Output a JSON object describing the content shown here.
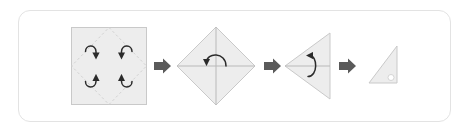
{
  "figure": {
    "title": "Paper folding sequence",
    "description": "Four-stage origami fold diagram inside a rounded white panel",
    "panel": {
      "border_color": "#e3e3e3",
      "background_color": "#ffffff",
      "corner_radius": "12"
    },
    "colors": {
      "paper_fill": "#ededed",
      "paper_stroke": "#c9c9c9",
      "crease_dashed": "#d2d2d2",
      "fold_line": "#b9b9b9",
      "rotate_arrow": "#2b2b2b",
      "step_arrow": "#5a5a5a",
      "dot_fill": "#ffffff"
    },
    "steps": [
      {
        "index": "1",
        "name": "square-with-diagonal-creases",
        "shape": "square",
        "label": "Square sheet with dashed diamond crease lines",
        "fold_arrows": "4",
        "fold_arrow_direction": "corners-to-center"
      },
      {
        "index": "2",
        "name": "diamond-folded",
        "shape": "diamond",
        "label": "Diamond with vertical and horizontal creases",
        "fold_arrows": "1",
        "fold_arrow_direction": "top-half-down"
      },
      {
        "index": "3",
        "name": "left-pointing-triangle",
        "shape": "triangle-left",
        "label": "Triangle pointing left with center crease",
        "fold_arrows": "1",
        "fold_arrow_direction": "upper-half-down"
      },
      {
        "index": "4",
        "name": "final-right-triangle",
        "shape": "right-triangle",
        "label": "Finished right triangle with corner dot",
        "fold_arrows": "0",
        "fold_arrow_direction": "none"
      }
    ],
    "connectors": [
      {
        "name": "step-arrow-1-to-2",
        "glyph": "arrow-right-icon"
      },
      {
        "name": "step-arrow-2-to-3",
        "glyph": "arrow-right-icon"
      },
      {
        "name": "step-arrow-3-to-4",
        "glyph": "arrow-right-icon"
      }
    ]
  }
}
